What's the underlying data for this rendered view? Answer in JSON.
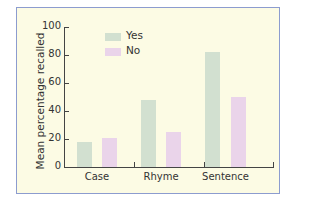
{
  "chart_data": {
    "type": "bar",
    "title": "",
    "xlabel": "",
    "ylabel": "Mean percentage recalled",
    "ylim": [
      0,
      100
    ],
    "yticks": [
      0,
      20,
      40,
      60,
      80,
      100
    ],
    "categories": [
      "Case",
      "Rhyme",
      "Sentence"
    ],
    "series": [
      {
        "name": "Yes",
        "color": "#d2e0d0",
        "values": [
          18,
          48,
          82
        ]
      },
      {
        "name": "No",
        "color": "#ead4ea",
        "values": [
          21,
          25,
          50
        ]
      }
    ],
    "legend_position": "upper-left-inside",
    "grid": false
  },
  "colors": {
    "background": "#fcfbe4",
    "border": "#8c9ccf",
    "axis": "#444444"
  }
}
